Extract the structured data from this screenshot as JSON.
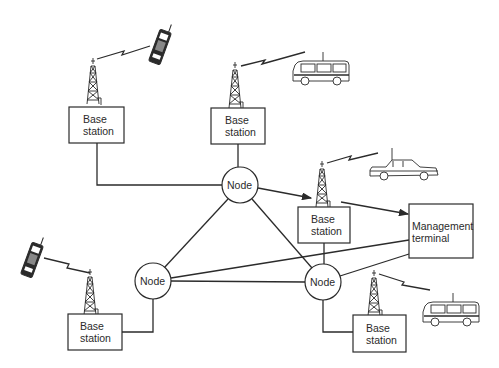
{
  "diagram": {
    "title": "",
    "base_stations": [
      {
        "id": "bs-top-left",
        "line1": "Base",
        "line2": "station"
      },
      {
        "id": "bs-top-center",
        "line1": "Base",
        "line2": "station"
      },
      {
        "id": "bs-center-right",
        "line1": "Base",
        "line2": "station"
      },
      {
        "id": "bs-bottom-left",
        "line1": "Base",
        "line2": "station"
      },
      {
        "id": "bs-bottom-right",
        "line1": "Base",
        "line2": "station"
      }
    ],
    "nodes": [
      {
        "id": "node-top",
        "label": "Node"
      },
      {
        "id": "node-left",
        "label": "Node"
      },
      {
        "id": "node-right",
        "label": "Node"
      }
    ],
    "management_terminal": {
      "line1": "Management",
      "line2": "terminal"
    },
    "mobile_units": [
      {
        "id": "handheld-phone-top",
        "type": "handheld-phone",
        "linked_to": "bs-top-left"
      },
      {
        "id": "minibus-top",
        "type": "minibus",
        "linked_to": "bs-top-center"
      },
      {
        "id": "car",
        "type": "car",
        "linked_to": "bs-center-right"
      },
      {
        "id": "handheld-phone-left",
        "type": "handheld-phone",
        "linked_to": "bs-bottom-left"
      },
      {
        "id": "minibus-bottom",
        "type": "minibus",
        "linked_to": "bs-bottom-right"
      }
    ],
    "connections": [
      {
        "from": "bs-top-left",
        "to": "node-top",
        "type": "wired"
      },
      {
        "from": "bs-top-center",
        "to": "node-top",
        "type": "wired"
      },
      {
        "from": "node-top",
        "to": "bs-center-right",
        "type": "arrow"
      },
      {
        "from": "bs-center-right",
        "to": "management-terminal",
        "type": "arrow"
      },
      {
        "from": "node-top",
        "to": "node-left",
        "type": "wired"
      },
      {
        "from": "node-top",
        "to": "node-right",
        "type": "wired"
      },
      {
        "from": "node-left",
        "to": "node-right",
        "type": "wired"
      },
      {
        "from": "node-left",
        "to": "management-terminal",
        "type": "wired"
      },
      {
        "from": "node-right",
        "to": "management-terminal",
        "type": "wired"
      },
      {
        "from": "bs-center-right",
        "to": "node-right",
        "type": "wired"
      },
      {
        "from": "node-left",
        "to": "bs-bottom-left",
        "type": "wired"
      },
      {
        "from": "node-right",
        "to": "bs-bottom-right",
        "type": "wired"
      }
    ]
  }
}
